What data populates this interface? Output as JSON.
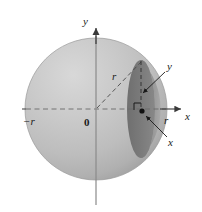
{
  "figure": {
    "background_color": "#ffffff",
    "axis_color": "#4d4d4d",
    "sphere_light_color": "#c8c8c8",
    "sphere_mid_color": "#b4b4b4",
    "cap_color": "#8f8f8f",
    "cross_section_color": "#7d7d7d",
    "label_color": "#1a1a1a",
    "labels": {
      "y_axis": "y",
      "x_axis": "x",
      "origin": "0",
      "negative_radius": "−r",
      "positive_radius": "r",
      "radius_diagonal": "r",
      "callout_y": "y",
      "callout_x": "x"
    },
    "geometry": {
      "sphere_center_x": 96,
      "sphere_center_y": 109,
      "sphere_radius": 71,
      "slice_plane_x": 141,
      "slice_half_height": 49,
      "slice_ellipse_rx": 14,
      "axis_x_start": 22,
      "axis_x_end": 181,
      "axis_y_top": 28,
      "axis_y_bottom": 205
    }
  }
}
